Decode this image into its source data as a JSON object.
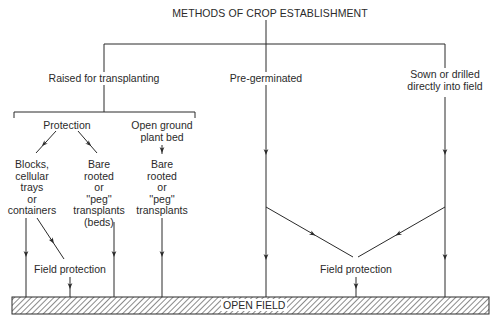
{
  "title": "METHODS OF CROP ESTABLISHMENT",
  "branches": {
    "raised": {
      "label": "Raised for transplanting",
      "sub": {
        "protection": {
          "label": "Protection",
          "blocks": [
            "Blocks,",
            "cellular",
            "trays",
            "or",
            "containers"
          ],
          "bare_beds": [
            "Bare",
            "rooted",
            "or",
            "''peg''",
            "transplants",
            "(beds)"
          ]
        },
        "open_ground": {
          "label_lines": [
            "Open ground",
            "plant bed"
          ],
          "bare": [
            "Bare",
            "rooted",
            "or",
            "''peg''",
            "transplants"
          ]
        }
      },
      "field_protection": "Field protection"
    },
    "pregerminated": {
      "label": "Pre-germinated"
    },
    "sown": {
      "label_lines": [
        "Sown or drilled",
        "directly into field"
      ]
    },
    "shared_field_protection": "Field protection"
  },
  "ground": {
    "label": "OPEN FIELD"
  },
  "colors": {
    "line": "#2a2a2a",
    "background": "#ffffff"
  }
}
